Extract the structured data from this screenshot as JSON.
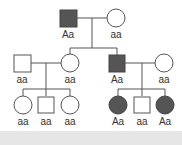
{
  "diagram": {
    "type": "pedigree",
    "colors": {
      "affected": "#555555",
      "unaffected": "#ffffff",
      "line": "#555555"
    },
    "generation_1": [
      {
        "id": "I-1",
        "sex": "male",
        "affected": true,
        "genotype": "Aa"
      },
      {
        "id": "I-2",
        "sex": "female",
        "affected": false,
        "genotype": "aa"
      }
    ],
    "generation_2": [
      {
        "id": "II-1",
        "sex": "male",
        "affected": false,
        "genotype": "aa"
      },
      {
        "id": "II-2",
        "sex": "female",
        "affected": false,
        "genotype": "aa"
      },
      {
        "id": "II-3",
        "sex": "male",
        "affected": true,
        "genotype": "Aa"
      },
      {
        "id": "II-4",
        "sex": "female",
        "affected": false,
        "genotype": "aa"
      }
    ],
    "generation_3": [
      {
        "id": "III-1",
        "sex": "female",
        "affected": false,
        "genotype": "aa"
      },
      {
        "id": "III-2",
        "sex": "male",
        "affected": false,
        "genotype": "aa"
      },
      {
        "id": "III-3",
        "sex": "female",
        "affected": false,
        "genotype": "aa"
      },
      {
        "id": "III-4",
        "sex": "female",
        "affected": true,
        "genotype": "Aa"
      },
      {
        "id": "III-5",
        "sex": "male",
        "affected": false,
        "genotype": "aa"
      },
      {
        "id": "III-6",
        "sex": "female",
        "affected": true,
        "genotype": "Aa"
      }
    ]
  }
}
